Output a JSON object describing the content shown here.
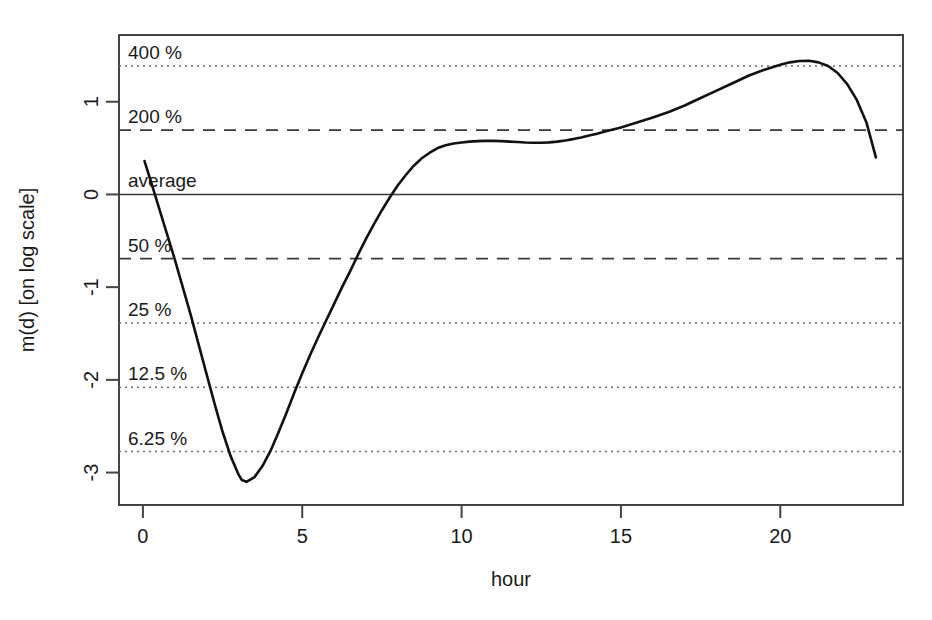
{
  "chart_data": {
    "type": "line",
    "title": "",
    "xlabel": "hour",
    "ylabel": "m(d) [on log scale]",
    "xlim": [
      -0.75,
      23.85
    ],
    "ylim": [
      -3.35,
      1.72
    ],
    "grid": true,
    "legend": "none",
    "xticks": [
      0,
      5,
      10,
      15,
      20
    ],
    "xtick_labels": [
      "0",
      "5",
      "10",
      "15",
      "20"
    ],
    "yticks": [
      1,
      0,
      -1,
      -2,
      -3
    ],
    "ytick_labels": [
      "1",
      "0",
      "-1",
      "-2",
      "-3"
    ],
    "reference_lines": [
      {
        "label": "400 %",
        "value": 1.386,
        "style": "dotted"
      },
      {
        "label": "200 %",
        "value": 0.693,
        "style": "dashed"
      },
      {
        "label": "average",
        "value": 0.0,
        "style": "solid"
      },
      {
        "label": "50 %",
        "value": -0.693,
        "style": "dashed"
      },
      {
        "label": "25 %",
        "value": -1.386,
        "style": "dotted"
      },
      {
        "label": "12.5 %",
        "value": -2.079,
        "style": "dotted"
      },
      {
        "label": "6.25 %",
        "value": -2.773,
        "style": "dotted"
      }
    ],
    "series": [
      {
        "name": "m(d)",
        "x": [
          0.05,
          0.25,
          0.5,
          0.75,
          1.0,
          1.25,
          1.5,
          1.75,
          2.0,
          2.25,
          2.5,
          2.75,
          3.0,
          3.1,
          3.25,
          3.5,
          3.75,
          4.0,
          4.25,
          4.5,
          4.75,
          5.0,
          5.25,
          5.5,
          5.75,
          6.0,
          6.25,
          6.5,
          6.75,
          7.0,
          7.25,
          7.5,
          7.75,
          8.0,
          8.25,
          8.5,
          8.75,
          9.0,
          9.25,
          9.5,
          9.75,
          10.0,
          10.25,
          10.5,
          10.75,
          11.0,
          11.25,
          11.5,
          11.75,
          12.0,
          12.25,
          12.5,
          12.75,
          13.0,
          13.25,
          13.5,
          13.75,
          14.0,
          14.25,
          14.5,
          14.75,
          15.0,
          15.25,
          15.5,
          16.0,
          16.5,
          17.0,
          17.5,
          18.0,
          18.5,
          19.0,
          19.5,
          20.0,
          20.3,
          20.6,
          20.9,
          21.2,
          21.5,
          21.8,
          22.1,
          22.4,
          22.7,
          23.0
        ],
        "y": [
          0.36,
          0.14,
          -0.14,
          -0.42,
          -0.7,
          -1.0,
          -1.3,
          -1.62,
          -1.94,
          -2.26,
          -2.56,
          -2.82,
          -3.02,
          -3.08,
          -3.1,
          -3.05,
          -2.93,
          -2.77,
          -2.57,
          -2.36,
          -2.14,
          -1.93,
          -1.73,
          -1.54,
          -1.36,
          -1.18,
          -1.0,
          -0.83,
          -0.65,
          -0.48,
          -0.32,
          -0.17,
          -0.03,
          0.1,
          0.21,
          0.31,
          0.39,
          0.45,
          0.5,
          0.53,
          0.55,
          0.56,
          0.57,
          0.575,
          0.578,
          0.578,
          0.575,
          0.57,
          0.565,
          0.56,
          0.558,
          0.558,
          0.562,
          0.57,
          0.582,
          0.597,
          0.615,
          0.635,
          0.656,
          0.678,
          0.7,
          0.723,
          0.748,
          0.775,
          0.83,
          0.89,
          0.96,
          1.04,
          1.12,
          1.2,
          1.28,
          1.345,
          1.4,
          1.425,
          1.44,
          1.442,
          1.425,
          1.385,
          1.31,
          1.19,
          1.02,
          0.78,
          0.4
        ]
      }
    ]
  },
  "axes": {
    "y_axis_title": "m(d) [on log scale]",
    "x_axis_title": "hour"
  }
}
